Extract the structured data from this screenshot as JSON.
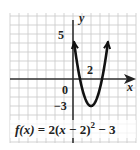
{
  "chart_data": {
    "type": "line",
    "function": "f(x) = 2(x - 2)^2 - 3",
    "xlabel": "x",
    "ylabel": "y",
    "xlim": [
      -7,
      7
    ],
    "ylim": [
      -7.2,
      7.3
    ],
    "grid": true,
    "tick_labels": {
      "y_top": "5",
      "x_mark": "2",
      "origin": "0",
      "y_bottom": "−3"
    },
    "vertex": [
      2,
      -3
    ],
    "series": [
      {
        "name": "f(x)",
        "x": [
          0.4,
          0.6,
          0.8,
          1.0,
          1.2,
          1.4,
          1.6,
          1.8,
          2.0,
          2.2,
          2.4,
          2.6,
          2.8,
          3.0,
          3.2,
          3.4,
          3.6
        ],
        "y": [
          2.12,
          0.92,
          -0.12,
          -1.0,
          -1.72,
          -2.28,
          -2.68,
          -2.92,
          -3.0,
          -2.92,
          -2.68,
          -2.28,
          -1.72,
          -1.0,
          -0.12,
          0.92,
          2.12
        ]
      }
    ]
  },
  "formula": {
    "lhs": "f(x)",
    "eq": " = 2(",
    "var": "x",
    "mid": " − 2)",
    "exp": "2",
    "tail": " − 3"
  },
  "axis_labels": {
    "x": "x",
    "y": "y"
  },
  "labels": {
    "five": "5",
    "two": "2",
    "zero": "0",
    "neg_three": "−3"
  },
  "colors": {
    "grid": "#c8c8c8",
    "axis": "#333333",
    "curve": "#111111",
    "text": "#222222"
  }
}
